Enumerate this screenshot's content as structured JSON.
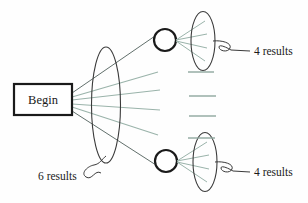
{
  "diagram": {
    "background_color": "#fefefe",
    "ink_color": "#262626",
    "fan_line_color": "#8ea79e",
    "nodes": {
      "start": {
        "label": "Begin",
        "shape": "rectangle",
        "x": 14,
        "y": 84,
        "width": 58,
        "height": 31,
        "stroke": "#1a1a1a",
        "stroke_width": 2
      },
      "top_circle": {
        "label": "",
        "shape": "circle",
        "cx": 165,
        "cy": 40,
        "r": 11,
        "stroke": "#1a1a1a",
        "stroke_width": 2
      },
      "bottom_circle": {
        "label": "",
        "shape": "circle",
        "cx": 166,
        "cy": 161,
        "r": 11,
        "stroke": "#1a1a1a",
        "stroke_width": 2
      }
    },
    "lenses": {
      "first_level": {
        "cx": 106,
        "cy": 105,
        "rx": 14,
        "ry": 58,
        "result_count": 6
      },
      "top_level_two": {
        "cx": 203,
        "cy": 41,
        "rx": 12,
        "ry": 29,
        "result_count": 4
      },
      "bottom_level_two": {
        "cx": 205,
        "cy": 162,
        "rx": 12,
        "ry": 29,
        "result_count": 4
      }
    },
    "annotations": [
      {
        "id": "first-level-count",
        "text": "6 results",
        "x": 38,
        "y": 179,
        "pointer_to": "first_level"
      },
      {
        "id": "top-branch-count",
        "text": "4 results",
        "x": 254,
        "y": 55,
        "pointer_to": "top_level_two"
      },
      {
        "id": "bottom-branch-count",
        "text": "4 results",
        "x": 254,
        "y": 176,
        "pointer_to": "bottom_level_two"
      }
    ],
    "fan_from_start": {
      "origin_x": 72,
      "origin_ys": [
        93,
        97,
        100,
        103,
        106,
        110
      ],
      "branches": [
        {
          "type": "to-node",
          "end_x": 155,
          "end_y": 36
        },
        {
          "type": "stub",
          "end_x": 158,
          "end_y": 72
        },
        {
          "type": "stub",
          "end_x": 160,
          "end_y": 90
        },
        {
          "type": "stub",
          "end_x": 160,
          "end_y": 110
        },
        {
          "type": "stub",
          "end_x": 158,
          "end_y": 135
        },
        {
          "type": "to-node",
          "end_x": 156,
          "end_y": 165
        }
      ]
    },
    "middle_stubs": {
      "x_start": 188,
      "x_end": 215,
      "ys": [
        72,
        96,
        116,
        138
      ],
      "color": "#8ea79e"
    },
    "top_branch_fan": {
      "origin_x": 176,
      "origin_y": 40,
      "end_x": 203,
      "end_ys": [
        20,
        33,
        47,
        60
      ],
      "count": 4
    },
    "bottom_branch_fan": {
      "origin_x": 177,
      "origin_y": 161,
      "end_x": 205,
      "end_ys": [
        141,
        154,
        168,
        181
      ],
      "count": 4
    }
  }
}
